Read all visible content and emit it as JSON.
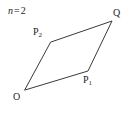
{
  "figure": {
    "background_color": "#ffffff",
    "stroke_color": "#3a3a3a",
    "text_color": "#1c1c1c",
    "parameter": {
      "variable": "n",
      "equals": "=",
      "value": "2"
    },
    "vertices": [
      {
        "id": "O",
        "label_main": "O",
        "label_sub": "",
        "x": 25,
        "y": 90
      },
      {
        "id": "P1",
        "label_main": "P",
        "label_sub": "1",
        "x": 88,
        "y": 71
      },
      {
        "id": "Q",
        "label_main": "Q",
        "label_sub": "",
        "x": 112,
        "y": 21
      },
      {
        "id": "P2",
        "label_main": "P",
        "label_sub": "2",
        "x": 51,
        "y": 42
      }
    ],
    "edges": [
      {
        "from": "O",
        "to": "P1"
      },
      {
        "from": "P1",
        "to": "Q"
      },
      {
        "from": "Q",
        "to": "P2"
      },
      {
        "from": "P2",
        "to": "O"
      }
    ],
    "shape_type": "parallelogram",
    "fill": "none"
  }
}
